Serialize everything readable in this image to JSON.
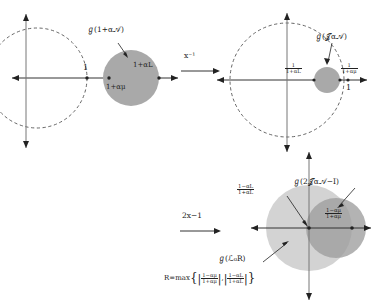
{
  "figure": {
    "panels": [
      {
        "id": "panel-one",
        "set_label": "ℊ(1+α𝒜)",
        "axis_tick": "1",
        "disk_right_label": "1+αL",
        "disk_left_label": "1+αμ",
        "has_dashed_circle": true,
        "dashed_circle_note": "unit-type dashed circle through 1"
      },
      {
        "id": "panel-two",
        "set_label": "ℊ(𝒥α𝒜)",
        "axis_tick": "1",
        "left_fraction": {
          "num": "1",
          "den": "1+αL"
        },
        "right_fraction": {
          "num": "1",
          "den": "1+αμ"
        },
        "has_dashed_circle": true
      },
      {
        "id": "panel-three",
        "set_label_dark": "ℊ(2𝒥α𝒜−I)",
        "set_label_light": "ℊ(ℒ₀R)",
        "upper_fraction": {
          "num": "1−αL",
          "den": "1+αL"
        },
        "right_fraction": {
          "num": "1−αμ",
          "den": "1+αμ"
        }
      }
    ],
    "arrows": [
      {
        "id": "arrow-inverse",
        "label": "x⁻¹"
      },
      {
        "id": "arrow-reflect",
        "label": "2x−1"
      }
    ],
    "formula": {
      "lhs": "R=max",
      "open_brace": "{",
      "term_one": {
        "num": "1−αμ",
        "den": "1+αμ"
      },
      "separator": ",",
      "term_two": {
        "num": "1−αL",
        "den": "1+αL"
      },
      "close_brace": "}",
      "abs_bar": "|"
    },
    "colors": {
      "disk_mid": "#a9a9a9",
      "disk_light": "#cfcfcf",
      "disk_dark": "#9d9d9d",
      "axis": "#333333",
      "dashed": "#555555"
    }
  }
}
